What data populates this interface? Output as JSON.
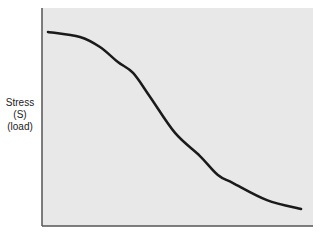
{
  "chart_data": {
    "type": "line",
    "title": "",
    "xlabel": "",
    "ylabel_lines": [
      "Stress",
      "(S)",
      "(load)"
    ],
    "xlim": [
      0,
      1
    ],
    "ylim": [
      0,
      1
    ],
    "grid": false,
    "legend": "none",
    "background": "#e8e8e8",
    "axis_color": "#555555",
    "line_color": "#1a1a1a",
    "series": [
      {
        "name": "Stress curve",
        "x": [
          0.022,
          0.14,
          0.214,
          0.28,
          0.336,
          0.399,
          0.491,
          0.583,
          0.649,
          0.705,
          0.83,
          0.956
        ],
        "y": [
          0.89,
          0.867,
          0.821,
          0.752,
          0.702,
          0.592,
          0.427,
          0.321,
          0.234,
          0.197,
          0.119,
          0.078
        ]
      }
    ]
  }
}
